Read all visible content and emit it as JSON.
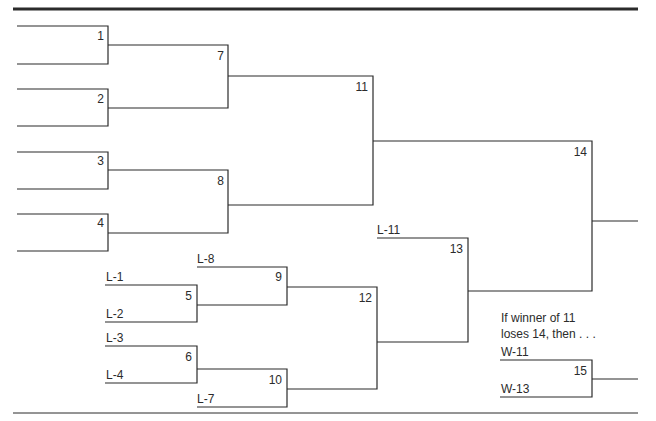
{
  "diagram": {
    "type": "double-elimination-bracket",
    "games": {
      "g1": "1",
      "g2": "2",
      "g3": "3",
      "g4": "4",
      "g5": "5",
      "g6": "6",
      "g7": "7",
      "g8": "8",
      "g9": "9",
      "g10": "10",
      "g11": "11",
      "g12": "12",
      "g13": "13",
      "g14": "14",
      "g15": "15"
    },
    "entries": {
      "l1": "L-1",
      "l2": "L-2",
      "l3": "L-3",
      "l4": "L-4",
      "l7": "L-7",
      "l8": "L-8",
      "l11": "L-11",
      "w11": "W-11",
      "w13": "W-13"
    },
    "note": {
      "line1": "If winner of 11",
      "line2": "loses 14, then . . ."
    },
    "colors": {
      "line": "#2b2b2b",
      "text": "#2b2b2b",
      "background": "#ffffff"
    }
  }
}
